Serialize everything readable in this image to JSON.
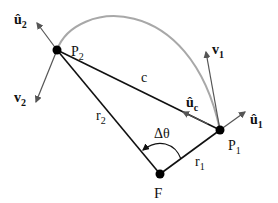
{
  "points": {
    "P1": {
      "label": "P",
      "sub": "1"
    },
    "P2": {
      "label": "P",
      "sub": "2"
    },
    "F": {
      "label": "F"
    }
  },
  "segments": {
    "chord": {
      "label": "c"
    },
    "r1": {
      "label": "r",
      "sub": "1"
    },
    "r2": {
      "label": "r",
      "sub": "2"
    }
  },
  "vectors": {
    "u1": {
      "label": "û",
      "sub": "1"
    },
    "u2": {
      "label": "û",
      "sub": "2"
    },
    "uc": {
      "label": "û",
      "sub": "c"
    },
    "v1": {
      "label": "v",
      "sub": "1"
    },
    "v2": {
      "label": "v",
      "sub": "2"
    }
  },
  "angle": {
    "label": "Δθ"
  },
  "colors": {
    "lines": "#111111",
    "arc": "#a8a8a8",
    "vectors": "#555555"
  }
}
